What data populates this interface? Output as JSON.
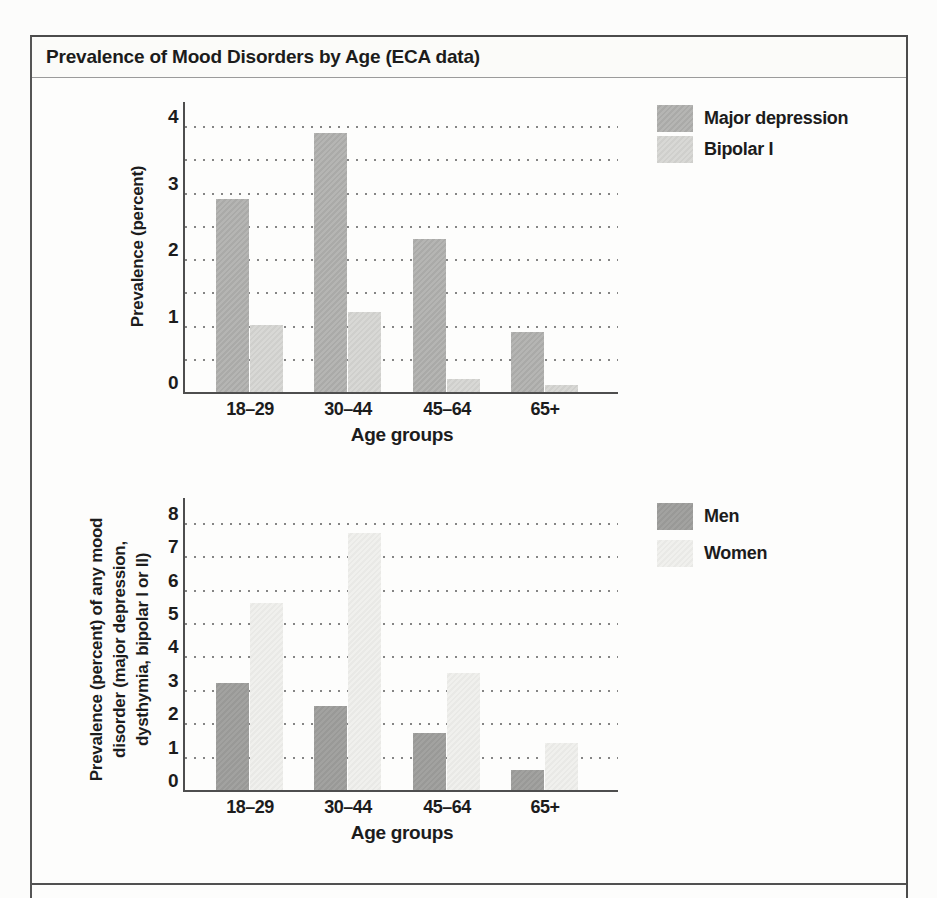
{
  "figure": {
    "title": "Prevalence of Mood Disorders by Age (ECA data)"
  },
  "chart_data": [
    {
      "type": "bar",
      "title": "",
      "categories": [
        "18–29",
        "30–44",
        "45–64",
        "65+"
      ],
      "series": [
        {
          "name": "Major depression",
          "values": [
            2.9,
            3.9,
            2.3,
            0.9
          ],
          "color": "#b5b5b3",
          "color2": "#aaaaa8"
        },
        {
          "name": "Bipolar I",
          "values": [
            1.0,
            1.2,
            0.2,
            0.1
          ],
          "color": "#d8d8d5",
          "color2": "#cfcfcc"
        }
      ],
      "xlabel": "Age groups",
      "ylabel": "Prevalence (percent)",
      "ylabel_lines": [
        "Prevalence (percent)"
      ],
      "ylim": [
        0,
        4
      ],
      "ytick_labels": [
        "0",
        "1",
        "2",
        "3",
        "4"
      ],
      "ytick_step": 1,
      "gridline_step": 0.5,
      "grid": "dotted-horizontal",
      "legend_position": "top-right-outside"
    },
    {
      "type": "bar",
      "title": "",
      "categories": [
        "18–29",
        "30–44",
        "45–64",
        "65+"
      ],
      "series": [
        {
          "name": "Men",
          "values": [
            3.2,
            2.5,
            1.7,
            0.6
          ],
          "color": "#a2a2a0",
          "color2": "#999997"
        },
        {
          "name": "Women",
          "values": [
            5.6,
            7.7,
            3.5,
            1.4
          ],
          "color": "#f0f0ed",
          "color2": "#e9e9e6"
        }
      ],
      "xlabel": "Age groups",
      "ylabel": "Prevalence (percent) of any mood disorder (major depression, dysthymia, bipolar I or II)",
      "ylabel_lines": [
        "Prevalence (percent) of any mood",
        "disorder (major depression,",
        "dysthymia, bipolar I or II)"
      ],
      "ylim": [
        0,
        8
      ],
      "ytick_labels": [
        "0",
        "1",
        "2",
        "3",
        "4",
        "5",
        "6",
        "7",
        "8"
      ],
      "ytick_step": 1,
      "gridline_step": 1,
      "grid": "dotted-horizontal",
      "legend_position": "top-right-outside"
    }
  ],
  "colors": {
    "frame_border": "#4b4b4b",
    "axis": "#4e4e4e",
    "gridline_dots": "#5d5d5d",
    "text": "#1c1c1c",
    "background": "#fdfdfc"
  }
}
